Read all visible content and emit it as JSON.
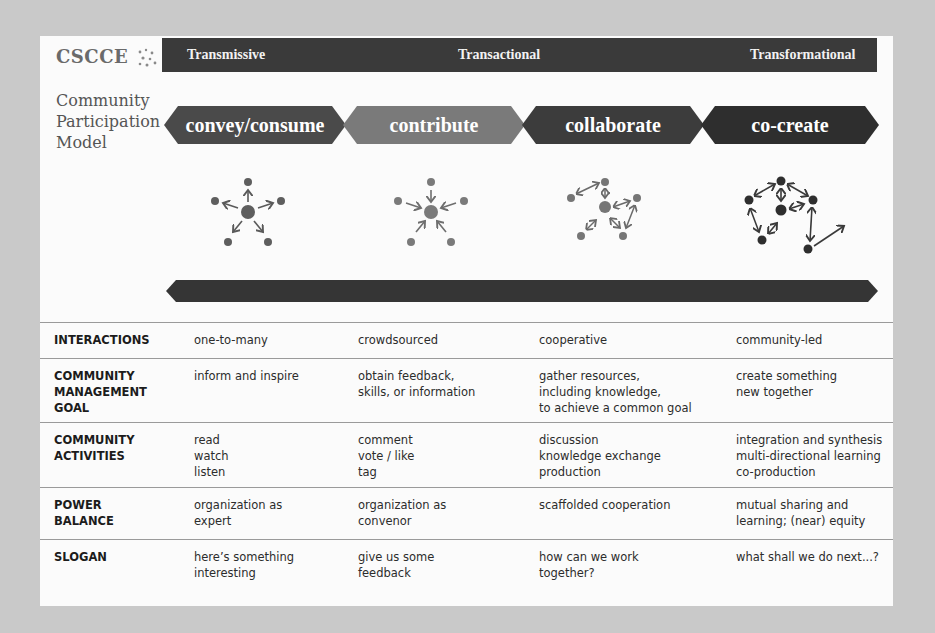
{
  "logo": {
    "text": "CSCCE",
    "icon": "network-dots-icon"
  },
  "title": "Community\nParticipation\nModel",
  "top_bar": {
    "labels": [
      "Transmissive",
      "Transactional",
      "Transformational"
    ],
    "color": "#3a3a3a"
  },
  "modes": [
    {
      "label": "convey/consume",
      "color": "#4a4a4a"
    },
    {
      "label": "contribute",
      "color": "#7a7a7a"
    },
    {
      "label": "collaborate",
      "color": "#3c3c3c"
    },
    {
      "label": "co-create",
      "color": "#2e2e2e"
    }
  ],
  "icons": [
    {
      "name": "broadcast-outward-arrows-icon"
    },
    {
      "name": "inward-arrows-icon"
    },
    {
      "name": "bidirectional-network-icon"
    },
    {
      "name": "co-creation-network-icon"
    }
  ],
  "table": {
    "rows": [
      {
        "label": "INTERACTIONS",
        "values": [
          "one-to-many",
          "crowdsourced",
          "cooperative",
          "community-led"
        ]
      },
      {
        "label": "COMMUNITY\nMANAGEMENT\nGOAL",
        "values": [
          "inform and inspire",
          "obtain feedback,\nskills, or information",
          "gather resources,\nincluding knowledge,\nto achieve a common goal",
          "create something\nnew together"
        ]
      },
      {
        "label": "COMMUNITY\nACTIVITIES",
        "values": [
          "read\nwatch\nlisten",
          "comment\nvote / like\ntag",
          "discussion\nknowledge exchange\nproduction",
          "integration and synthesis\nmulti-directional learning\nco-production"
        ]
      },
      {
        "label": "POWER\nBALANCE",
        "values": [
          "organization as\nexpert",
          "organization as\nconvenor",
          "scaffolded cooperation",
          "mutual sharing and\nlearning; (near) equity"
        ]
      },
      {
        "label": "SLOGAN",
        "values": [
          "here’s something\ninteresting",
          "give us some\nfeedback",
          "how can we work\ntogether?",
          "what shall we do next...?"
        ]
      }
    ]
  }
}
